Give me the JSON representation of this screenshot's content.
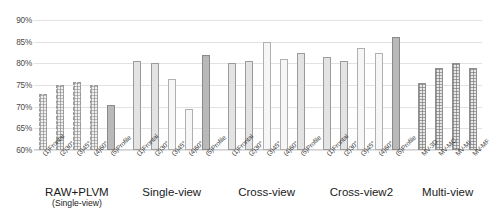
{
  "chart_data": {
    "type": "bar",
    "title": "",
    "xlabel": "",
    "ylabel": "",
    "ylim": [
      60,
      90
    ],
    "ytick_labels": [
      "60%",
      "65%",
      "70%",
      "75%",
      "80%",
      "85%",
      "90%"
    ],
    "ytick_values": [
      60,
      65,
      70,
      75,
      80,
      85,
      90
    ],
    "grid": true,
    "legend": "none",
    "groups": [
      {
        "name": "RAW+PLVM",
        "subtitle": "(Single-view)",
        "categories": [
          "(1)Frontal",
          "(2)30°",
          "(3)45°",
          "(4)60°",
          "(5)Profile"
        ],
        "values": [
          73.0,
          75.0,
          75.6,
          75.0,
          70.5
        ],
        "fills": [
          "dotted",
          "dotted",
          "dotted",
          "dotted",
          "dark"
        ]
      },
      {
        "name": "Single-view",
        "subtitle": "",
        "categories": [
          "(1)Frontal",
          "(2)30°",
          "(3)45°",
          "(4)60°",
          "(5)Profile"
        ],
        "values": [
          80.5,
          80.0,
          76.5,
          69.5,
          82.0
        ],
        "fills": [
          "medium",
          "medium",
          "light",
          "light",
          "dark"
        ]
      },
      {
        "name": "Cross-view",
        "subtitle": "",
        "categories": [
          "(1)Frontal",
          "(2)30°",
          "(3)45°",
          "(4)60°",
          "(5)Profile"
        ],
        "values": [
          80.0,
          80.5,
          85.0,
          81.0,
          82.5
        ],
        "fills": [
          "medium",
          "medium",
          "light",
          "light",
          "medium"
        ]
      },
      {
        "name": "Cross-view2",
        "subtitle": "",
        "categories": [
          "(1)Frontal",
          "(2)30°",
          "(3)45°",
          "(4)60°",
          "(5)Profile"
        ],
        "values": [
          81.5,
          80.5,
          83.5,
          82.5,
          86.0
        ],
        "fills": [
          "medium",
          "medium",
          "light",
          "light",
          "dark"
        ]
      },
      {
        "name": "Multi-view",
        "subtitle": "",
        "categories": [
          "MV-3D",
          "MV-MC",
          "MV-MI",
          "MV-MF"
        ],
        "values": [
          75.5,
          79.0,
          80.0,
          79.0
        ],
        "fills": [
          "grid",
          "grid",
          "grid",
          "grid"
        ]
      }
    ]
  },
  "colors": {
    "gridline": "#e2e2e2",
    "bar_light": "#f6f6f6",
    "bar_medium": "#e3e3e3",
    "bar_dark": "#b9b9b9",
    "bar_outline": "#9a9a9a",
    "text": "#3c3c3c",
    "background": "#ffffff"
  }
}
